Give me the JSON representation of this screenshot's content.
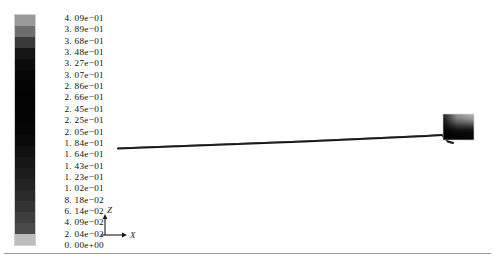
{
  "window": {
    "title": "Contour Plot"
  },
  "colorbar": {
    "name": "contour-colorbar",
    "orientation": "vertical",
    "colormap": "grayscale",
    "min": "0.00e+00",
    "max": "4.09e-01",
    "levels": 21,
    "labels": [
      "4. 09e−01",
      "3. 89e−01",
      "3. 68e−01",
      "3. 48e−01",
      "3. 27e−01",
      "3. 07e−01",
      "2. 86e−01",
      "2. 66e−01",
      "2. 45e−01",
      "2. 25e−01",
      "2. 05e−01",
      "1. 84e−01",
      "1. 64e−01",
      "1. 43e−01",
      "1. 23e−01",
      "1. 02e−01",
      "8. 18e−02",
      "6. 14e−02",
      "4. 09e−02",
      "2. 04e−02",
      "0. 00e+00"
    ],
    "values": [
      0.409,
      0.389,
      0.368,
      0.348,
      0.327,
      0.307,
      0.286,
      0.266,
      0.245,
      0.225,
      0.205,
      0.184,
      0.164,
      0.143,
      0.123,
      0.102,
      0.0818,
      0.0614,
      0.0409,
      0.0204,
      0.0
    ],
    "band_colors": [
      "#9a9a9a",
      "#6e6e6e",
      "#3a3a3a",
      "#151515",
      "#0b0b0b",
      "#060606",
      "#040404",
      "#030303",
      "#030303",
      "#040404",
      "#060606",
      "#0a0a0a",
      "#101010",
      "#161616",
      "#1c1c1c",
      "#222222",
      "#2a2a2a",
      "#333333",
      "#3d3d3d",
      "#4a4a4a",
      "#bdbdbd"
    ]
  },
  "axis_triad": {
    "name": "axis-orientation-triad",
    "vertical_label": "Z",
    "horizontal_label": "X"
  },
  "geometry": {
    "name": "model-geometry",
    "description": "slender beam with end block",
    "line_color": "#111111",
    "block": {
      "name": "end-block",
      "fill_top": "#b9b9b9",
      "fill_bottom": "#050505"
    }
  },
  "colors": {
    "background": "#ffffff",
    "text": "#111111",
    "rule": "#9a9a9a"
  }
}
